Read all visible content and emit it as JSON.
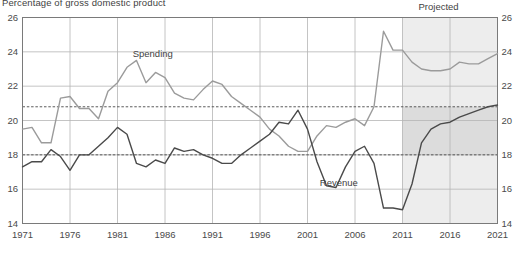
{
  "chart_data": {
    "type": "line",
    "title": "Percentage of gross domestic product",
    "xlabel": "",
    "ylabel": "",
    "xlim": [
      1971,
      2021
    ],
    "ylim": [
      14,
      26
    ],
    "ytick_values": [
      14,
      16,
      18,
      20,
      22,
      24,
      26
    ],
    "ytick_labels": [
      "14",
      "16",
      "18",
      "20",
      "22",
      "24",
      "26"
    ],
    "xtick_values": [
      1971,
      1976,
      1981,
      1986,
      1991,
      1996,
      2001,
      2006,
      2011,
      2016,
      2021
    ],
    "xtick_labels": [
      "1971",
      "1976",
      "1981",
      "1986",
      "1991",
      "1996",
      "2001",
      "2006",
      "2011",
      "2016",
      "2021"
    ],
    "grid": true,
    "legend_position": "inline-annotations",
    "annotations": [
      {
        "name": "projected-label",
        "text": "Projected",
        "x": 2015.0,
        "y": 26.6
      },
      {
        "name": "spending-label",
        "text": "Spending",
        "x": 1982.6,
        "y": 23.85
      },
      {
        "name": "revenue-label",
        "text": "Revenue",
        "x": 2002.3,
        "y": 16.35
      }
    ],
    "reference_lines": [
      {
        "name": "spending-average",
        "value": 20.8,
        "style": "dashed",
        "color": "#4a4a4a"
      },
      {
        "name": "revenue-average",
        "value": 18.0,
        "style": "dashed",
        "color": "#4a4a4a"
      }
    ],
    "shaded_regions": [
      {
        "name": "projected-span",
        "x_start": 2011.0,
        "x_end": 2021.0,
        "y_start": 14,
        "y_end": 26,
        "color": "#ededed"
      },
      {
        "name": "projected-average-band",
        "x_start": 2011.0,
        "x_end": 2021.0,
        "y_start": 18.0,
        "y_end": 20.8,
        "color": "#dcdcdc"
      }
    ],
    "x": [
      1971,
      1972,
      1973,
      1974,
      1975,
      1976,
      1977,
      1978,
      1979,
      1980,
      1981,
      1982,
      1983,
      1984,
      1985,
      1986,
      1987,
      1988,
      1989,
      1990,
      1991,
      1992,
      1993,
      1994,
      1995,
      1996,
      1997,
      1998,
      1999,
      2000,
      2001,
      2002,
      2003,
      2004,
      2005,
      2006,
      2007,
      2008,
      2009,
      2010,
      2011,
      2012,
      2013,
      2014,
      2015,
      2016,
      2017,
      2018,
      2019,
      2020,
      2021
    ],
    "series": [
      {
        "name": "Spending",
        "color": "#9b9b9b",
        "values": [
          19.5,
          19.6,
          18.7,
          18.7,
          21.3,
          21.4,
          20.7,
          20.7,
          20.1,
          21.7,
          22.2,
          23.1,
          23.5,
          22.2,
          22.8,
          22.5,
          21.6,
          21.3,
          21.2,
          21.8,
          22.3,
          22.1,
          21.4,
          21.0,
          20.6,
          20.2,
          19.5,
          19.1,
          18.5,
          18.2,
          18.2,
          19.1,
          19.7,
          19.6,
          19.9,
          20.1,
          19.7,
          20.8,
          25.2,
          24.1,
          24.1,
          23.4,
          23.0,
          22.9,
          22.9,
          23.0,
          23.4,
          23.3,
          23.3,
          23.6,
          23.9
        ]
      },
      {
        "name": "Revenue",
        "color": "#4a4a4a",
        "values": [
          17.3,
          17.6,
          17.6,
          18.3,
          17.9,
          17.1,
          18.0,
          18.0,
          18.5,
          19.0,
          19.6,
          19.2,
          17.5,
          17.3,
          17.7,
          17.5,
          18.4,
          18.2,
          18.3,
          18.0,
          17.8,
          17.5,
          17.5,
          18.0,
          18.4,
          18.8,
          19.2,
          19.9,
          19.8,
          20.6,
          19.5,
          17.6,
          16.2,
          16.1,
          17.3,
          18.2,
          18.5,
          17.5,
          14.9,
          14.9,
          14.8,
          16.3,
          18.7,
          19.5,
          19.8,
          19.9,
          20.2,
          20.4,
          20.6,
          20.8,
          20.9
        ]
      }
    ]
  }
}
